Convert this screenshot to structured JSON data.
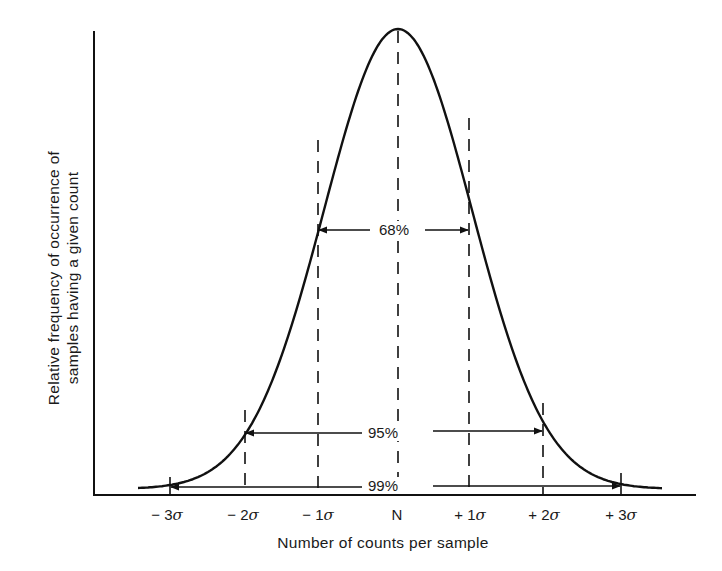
{
  "chart_data": {
    "type": "line",
    "title": "",
    "xlabel": "Number of counts per sample",
    "ylabel": "Relative frequency of occurrence of samples having a given count",
    "ylabel_lines": [
      "Relative frequency of occurrence of",
      "samples having a given count"
    ],
    "x_ticks": [
      {
        "label": "− 3σ",
        "sigma": -3
      },
      {
        "label": "− 2σ",
        "sigma": -2
      },
      {
        "label": "− 1σ",
        "sigma": -1
      },
      {
        "label": "N",
        "sigma": 0
      },
      {
        "label": "+ 1σ",
        "sigma": 1
      },
      {
        "label": "+ 2σ",
        "sigma": 2
      },
      {
        "label": "+ 3σ",
        "sigma": 3
      }
    ],
    "series": [
      {
        "name": "Gaussian curve",
        "style": "solid",
        "x_sigma_range": [
          -3.5,
          3.5
        ],
        "peak_at": "N"
      }
    ],
    "intervals": [
      {
        "label": "68%",
        "from_sigma": -1,
        "to_sigma": 1
      },
      {
        "label": "95%",
        "from_sigma": -2,
        "to_sigma": 2
      },
      {
        "label": "99%",
        "from_sigma": -3,
        "to_sigma": 3
      }
    ],
    "grid": false,
    "legend": null,
    "annotations": [
      "dashed vertical lines at N, ±1σ, ±2σ; solid ticks at ±3σ"
    ]
  },
  "labels": {
    "pct68": "68%",
    "pct95": "95%",
    "pct99": "99%",
    "ylabel_line1": "Relative frequency of occurrence of",
    "ylabel_line2": "samples having a given count",
    "xlabel": "Number of counts per sample",
    "ticks": {
      "m3": {
        "sign": "− 3",
        "sym": "σ"
      },
      "m2": {
        "sign": "− 2",
        "sym": "σ"
      },
      "m1": {
        "sign": "− 1",
        "sym": "σ"
      },
      "n": "N",
      "p1": {
        "sign": "+ 1",
        "sym": "σ"
      },
      "p2": {
        "sign": "+ 2",
        "sym": "σ"
      },
      "p3": {
        "sign": "+ 3",
        "sym": "σ"
      }
    }
  },
  "colors": {
    "ink": "#111111",
    "background": "#ffffff"
  }
}
